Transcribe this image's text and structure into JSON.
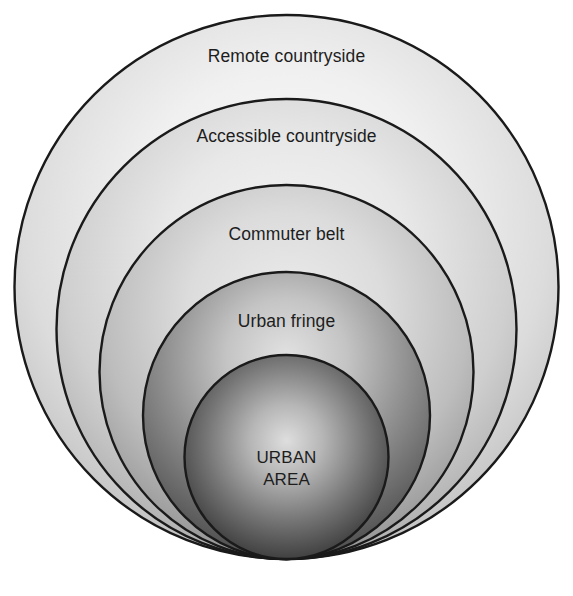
{
  "diagram": {
    "background_color": "#ffffff",
    "outline_color": "#1a1a1a",
    "text_color": "#1d1d1d",
    "zones": [
      {
        "id": "remote-countryside",
        "label": "Remote countryside",
        "order": 1,
        "position": "outermost",
        "fill_light": "#fbfbfb",
        "fill_dark": "#c8c8c8"
      },
      {
        "id": "accessible-countryside",
        "label": "Accessible countryside",
        "order": 2,
        "position": "second",
        "fill_light": "#f2f2f2",
        "fill_dark": "#b4b4b4"
      },
      {
        "id": "commuter-belt",
        "label": "Commuter belt",
        "order": 3,
        "position": "third",
        "fill_light": "#e6e6e6",
        "fill_dark": "#9a9a9a"
      },
      {
        "id": "urban-fringe",
        "label": "Urban fringe",
        "order": 4,
        "position": "fourth",
        "fill_light": "#dcdcdc",
        "fill_dark": "#565656"
      },
      {
        "id": "urban-area",
        "label_line_1": "URBAN",
        "label_line_2": "AREA",
        "order": 5,
        "position": "innermost",
        "fill_light": "#d8d8d8",
        "fill_dark": "#2b2b2b"
      }
    ]
  },
  "caption": {
    "clipped_text": ""
  }
}
